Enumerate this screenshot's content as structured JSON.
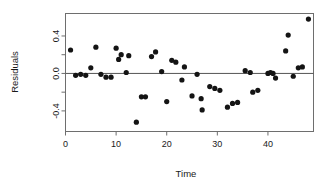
{
  "chart_data": {
    "type": "scatter",
    "title": "",
    "xlabel": "Time",
    "ylabel": "Residuals",
    "xlim": [
      0,
      49
    ],
    "ylim": [
      -0.62,
      0.64
    ],
    "grid": false,
    "legend": null,
    "xticks": [
      0,
      10,
      20,
      30,
      40
    ],
    "xtick_labels": [
      "0",
      "10",
      "20",
      "30",
      "40"
    ],
    "yticks": [
      -0.4,
      0.0,
      0.4
    ],
    "ytick_labels": [
      "-0.4",
      "0.0",
      "0.4"
    ],
    "yminor_ticks": [
      -0.2,
      0.2
    ],
    "reference_lines": [
      {
        "orientation": "horizontal",
        "value": 0.0
      }
    ],
    "marker": {
      "style": "filled-circle",
      "color": "#141414",
      "size": 2.6
    },
    "x": [
      1,
      2,
      3,
      4,
      5,
      6,
      7,
      8,
      9,
      10,
      11,
      12,
      13,
      14,
      15,
      16,
      17,
      18,
      19,
      20,
      21,
      22,
      23,
      24,
      25,
      26,
      27,
      28,
      29,
      30,
      31,
      32,
      33,
      34,
      35,
      36,
      37,
      38,
      39,
      40,
      41,
      42,
      43,
      44,
      45,
      46,
      47,
      48
    ],
    "y": [
      0.25,
      -0.02,
      -0.01,
      -0.02,
      0.06,
      0.28,
      -0.01,
      -0.04,
      -0.04,
      0.27,
      0.15,
      0.2,
      0.01,
      0.19,
      -0.52,
      -0.25,
      -0.25,
      0.18,
      0.23,
      0.02,
      -0.3,
      0.14,
      0.12,
      -0.07,
      0.07,
      -0.24,
      -0.01,
      -0.27,
      -0.39,
      -0.14,
      -0.16,
      -0.18,
      -0.36,
      -0.32,
      -0.31,
      0.03,
      0.01,
      -0.2,
      -0.18,
      0.0,
      0.01,
      0.0,
      -0.05,
      0.24,
      0.41,
      -0.03,
      0.06,
      0.07,
      0.58
    ],
    "series": [
      {
        "name": "Residuals",
        "points": [
          {
            "x": 1,
            "y": 0.25
          },
          {
            "x": 2,
            "y": -0.02
          },
          {
            "x": 3,
            "y": -0.01
          },
          {
            "x": 4,
            "y": -0.02
          },
          {
            "x": 5,
            "y": 0.06
          },
          {
            "x": 6,
            "y": 0.28
          },
          {
            "x": 7,
            "y": -0.01
          },
          {
            "x": 8,
            "y": -0.04
          },
          {
            "x": 9,
            "y": -0.04
          },
          {
            "x": 10,
            "y": 0.27
          },
          {
            "x": 10.5,
            "y": 0.15
          },
          {
            "x": 11,
            "y": 0.2
          },
          {
            "x": 12,
            "y": 0.01
          },
          {
            "x": 12.5,
            "y": 0.19
          },
          {
            "x": 14,
            "y": -0.52
          },
          {
            "x": 15,
            "y": -0.25
          },
          {
            "x": 15.8,
            "y": -0.25
          },
          {
            "x": 17,
            "y": 0.18
          },
          {
            "x": 17.8,
            "y": 0.23
          },
          {
            "x": 19,
            "y": 0.02
          },
          {
            "x": 20,
            "y": -0.3
          },
          {
            "x": 21,
            "y": 0.14
          },
          {
            "x": 21.8,
            "y": 0.12
          },
          {
            "x": 23,
            "y": -0.07
          },
          {
            "x": 23.5,
            "y": 0.07
          },
          {
            "x": 25,
            "y": -0.24
          },
          {
            "x": 26,
            "y": -0.01
          },
          {
            "x": 26.8,
            "y": -0.27
          },
          {
            "x": 27,
            "y": -0.39
          },
          {
            "x": 28.5,
            "y": -0.14
          },
          {
            "x": 29.5,
            "y": -0.16
          },
          {
            "x": 30.5,
            "y": -0.18
          },
          {
            "x": 32,
            "y": -0.36
          },
          {
            "x": 33,
            "y": -0.32
          },
          {
            "x": 34,
            "y": -0.31
          },
          {
            "x": 35.5,
            "y": 0.03
          },
          {
            "x": 36.5,
            "y": 0.01
          },
          {
            "x": 37,
            "y": -0.2
          },
          {
            "x": 38,
            "y": -0.18
          },
          {
            "x": 40,
            "y": 0.0
          },
          {
            "x": 40.5,
            "y": 0.01
          },
          {
            "x": 41,
            "y": 0.0
          },
          {
            "x": 41.5,
            "y": -0.05
          },
          {
            "x": 43.5,
            "y": 0.24
          },
          {
            "x": 44,
            "y": 0.41
          },
          {
            "x": 45,
            "y": -0.03
          },
          {
            "x": 46,
            "y": 0.06
          },
          {
            "x": 46.8,
            "y": 0.07
          },
          {
            "x": 48,
            "y": 0.58
          }
        ]
      }
    ]
  },
  "labels": {
    "xlabel": "Time",
    "ylabel": "Residuals"
  }
}
